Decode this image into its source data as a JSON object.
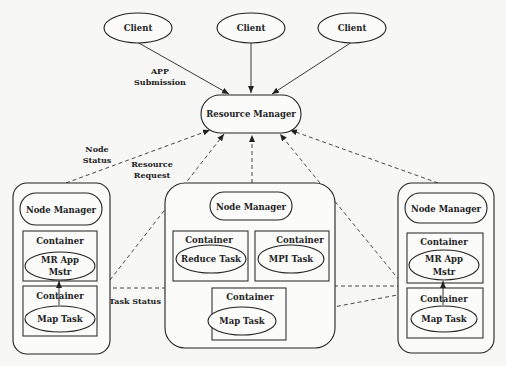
{
  "diagram": {
    "type": "YARN architecture",
    "clients": [
      {
        "label": "Client"
      },
      {
        "label": "Client"
      },
      {
        "label": "Client"
      }
    ],
    "resource_manager": {
      "label": "Resource Manager"
    },
    "nodes": [
      {
        "node_manager": "Node Manager",
        "containers": [
          {
            "label": "Container",
            "task": "MR App",
            "task_line2": "Mstr"
          },
          {
            "label": "Container",
            "task": "Map Task"
          }
        ]
      },
      {
        "node_manager": "Node Manager",
        "containers": [
          {
            "label": "Container",
            "task": "Reduce Task"
          },
          {
            "label": "Container",
            "task": "MPI Task"
          },
          {
            "label": "Container",
            "task": "Map Task"
          }
        ]
      },
      {
        "node_manager": "Node Manager",
        "containers": [
          {
            "label": "Container",
            "task": "MR App",
            "task_line2": "Mstr"
          },
          {
            "label": "Container",
            "task": "Map Task"
          }
        ]
      }
    ],
    "edge_labels": {
      "app_submission_1": "APP",
      "app_submission_2": "Submission",
      "node_status_1": "Node",
      "node_status_2": "Status",
      "resource_request_1": "Resource",
      "resource_request_2": "Request",
      "task_status": "Task Status"
    }
  }
}
